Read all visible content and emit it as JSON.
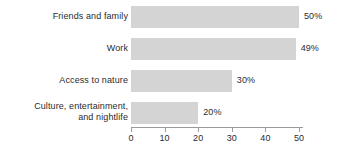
{
  "chart_data": {
    "type": "bar",
    "orientation": "horizontal",
    "title": "",
    "subtitle": "",
    "xlabel": "",
    "ylabel": "",
    "categories": [
      "Friends and family",
      "Work",
      "Access to nature",
      "Culture, entertainment,\nand nightlife"
    ],
    "values": [
      50,
      49,
      30,
      20
    ],
    "value_labels": [
      "50%",
      "49%",
      "30%",
      "20%"
    ],
    "xlim": [
      0,
      50
    ],
    "xticks": [
      0,
      10,
      20,
      30,
      40,
      50
    ],
    "xtick_labels": [
      "0",
      "10",
      "20",
      "30",
      "40",
      "50"
    ],
    "grid": false,
    "legend": false,
    "bar_color": "#d4d4d4",
    "text_color": "#2b2b2b",
    "axis_color": "#9a9a9a",
    "background": "#ffffff"
  }
}
